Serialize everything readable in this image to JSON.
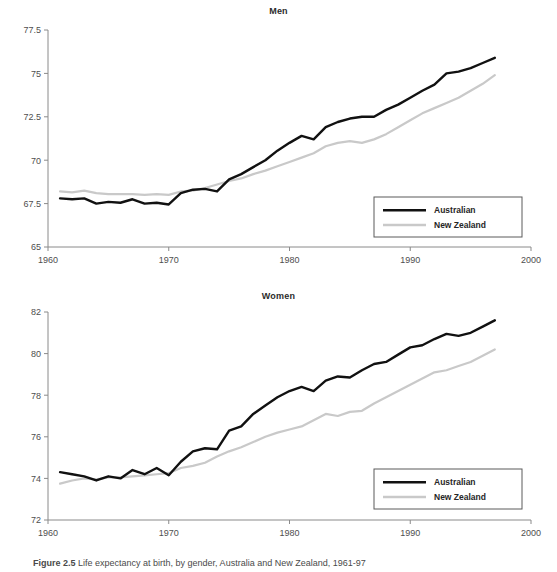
{
  "figure": {
    "caption_prefix": "Figure 2.5",
    "caption_text": "Life expectancy at birth, by gender, Australia and New Zealand, 1961-97"
  },
  "colors": {
    "australian": "#111111",
    "new_zealand": "#c9c9c9",
    "axis": "#8a8a8a",
    "text": "#4e4e4e"
  },
  "panels": {
    "men": {
      "title": "Men",
      "y_ticks": [
        "65",
        "67.5",
        "70",
        "72.5",
        "75",
        "77.5"
      ],
      "x_ticks": [
        "1960",
        "1970",
        "1980",
        "1990",
        "2000"
      ],
      "legend": {
        "australian": "Australian",
        "new_zealand": "New Zealand"
      }
    },
    "women": {
      "title": "Women",
      "y_ticks": [
        "72",
        "74",
        "76",
        "78",
        "80",
        "82"
      ],
      "x_ticks": [
        "1960",
        "1970",
        "1980",
        "1990",
        "2000"
      ],
      "legend": {
        "australian": "Australian",
        "new_zealand": "New Zealand"
      }
    }
  },
  "chart_data": [
    {
      "type": "line",
      "title": "Men",
      "xlabel": "",
      "ylabel": "",
      "xlim": [
        1960,
        2000
      ],
      "ylim": [
        65,
        77.5
      ],
      "y_ticks": [
        65,
        67.5,
        70,
        72.5,
        75,
        77.5
      ],
      "x_ticks": [
        1960,
        1970,
        1980,
        1990,
        2000
      ],
      "grid": false,
      "legend_position": "bottom-right",
      "x": [
        1961,
        1962,
        1963,
        1964,
        1965,
        1966,
        1967,
        1968,
        1969,
        1970,
        1971,
        1972,
        1973,
        1974,
        1975,
        1976,
        1977,
        1978,
        1979,
        1980,
        1981,
        1982,
        1983,
        1984,
        1985,
        1986,
        1987,
        1988,
        1989,
        1990,
        1991,
        1992,
        1993,
        1994,
        1995,
        1996,
        1997
      ],
      "series": [
        {
          "name": "Australian",
          "color": "#111111",
          "values": [
            67.8,
            67.75,
            67.8,
            67.5,
            67.6,
            67.55,
            67.75,
            67.5,
            67.55,
            67.45,
            68.1,
            68.3,
            68.35,
            68.2,
            68.9,
            69.2,
            69.6,
            70.0,
            70.55,
            71.0,
            71.4,
            71.2,
            71.9,
            72.2,
            72.4,
            72.5,
            72.5,
            72.9,
            73.2,
            73.6,
            74.0,
            74.35,
            75.0,
            75.1,
            75.3,
            75.6,
            75.9
          ]
        },
        {
          "name": "New Zealand",
          "color": "#c9c9c9",
          "values": [
            68.2,
            68.15,
            68.25,
            68.1,
            68.05,
            68.05,
            68.05,
            68.0,
            68.05,
            68.0,
            68.2,
            68.25,
            68.4,
            68.6,
            68.8,
            68.95,
            69.2,
            69.4,
            69.65,
            69.9,
            70.15,
            70.4,
            70.8,
            71.0,
            71.1,
            71.0,
            71.2,
            71.5,
            71.9,
            72.3,
            72.7,
            73.0,
            73.3,
            73.6,
            74.0,
            74.4,
            74.9
          ]
        }
      ]
    },
    {
      "type": "line",
      "title": "Women",
      "xlabel": "",
      "ylabel": "",
      "xlim": [
        1960,
        2000
      ],
      "ylim": [
        72,
        82
      ],
      "y_ticks": [
        72,
        74,
        76,
        78,
        80,
        82
      ],
      "x_ticks": [
        1960,
        1970,
        1980,
        1990,
        2000
      ],
      "grid": false,
      "legend_position": "bottom-right",
      "x": [
        1961,
        1962,
        1963,
        1964,
        1965,
        1966,
        1967,
        1968,
        1969,
        1970,
        1971,
        1972,
        1973,
        1974,
        1975,
        1976,
        1977,
        1978,
        1979,
        1980,
        1981,
        1982,
        1983,
        1984,
        1985,
        1986,
        1987,
        1988,
        1989,
        1990,
        1991,
        1992,
        1993,
        1994,
        1995,
        1996,
        1997
      ],
      "series": [
        {
          "name": "Australian",
          "color": "#111111",
          "values": [
            74.3,
            74.2,
            74.1,
            73.9,
            74.1,
            74.0,
            74.4,
            74.2,
            74.5,
            74.15,
            74.8,
            75.3,
            75.45,
            75.4,
            76.3,
            76.5,
            77.1,
            77.5,
            77.9,
            78.2,
            78.4,
            78.2,
            78.7,
            78.9,
            78.85,
            79.2,
            79.5,
            79.6,
            79.95,
            80.3,
            80.4,
            80.7,
            80.95,
            80.85,
            81.0,
            81.3,
            81.6
          ]
        },
        {
          "name": "New Zealand",
          "color": "#c9c9c9",
          "values": [
            73.75,
            73.9,
            74.0,
            73.95,
            74.05,
            74.05,
            74.1,
            74.15,
            74.2,
            74.25,
            74.5,
            74.6,
            74.75,
            75.05,
            75.3,
            75.5,
            75.75,
            76.0,
            76.2,
            76.35,
            76.5,
            76.8,
            77.1,
            77.0,
            77.2,
            77.25,
            77.6,
            77.9,
            78.2,
            78.5,
            78.8,
            79.1,
            79.2,
            79.4,
            79.6,
            79.9,
            80.2
          ]
        }
      ]
    }
  ]
}
